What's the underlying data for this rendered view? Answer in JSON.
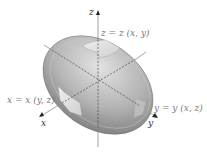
{
  "figure": {
    "type": "3d-surface-diagram",
    "axes": {
      "x": "x",
      "y": "y",
      "z": "z"
    },
    "surface_labels": {
      "z_patch": "z = z (x, y)",
      "x_patch": "x = x (y, z)",
      "y_patch": "y = y (x, z)"
    },
    "colors": {
      "surface_light": "#d6d6d6",
      "surface_dark": "#7c7c7c",
      "patch": "#e4e4e4",
      "axis": "#555555",
      "label": "#7a7a7a"
    }
  }
}
